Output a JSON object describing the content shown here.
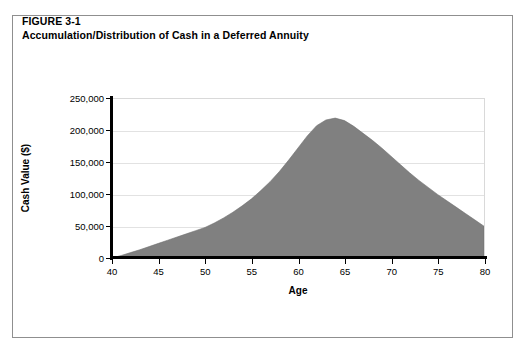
{
  "figure": {
    "label": "FIGURE 3-1",
    "caption": "Accumulation/Distribution of Cash in a Deferred Annuity"
  },
  "colors": {
    "area_fill": "#808080",
    "axis": "#000000",
    "gridline": "#e2e2e2",
    "border": "#8f8f8f",
    "background": "#ffffff"
  },
  "chart_data": {
    "type": "area",
    "title": "Accumulation/Distribution of Cash in a Deferred Annuity",
    "subtitle": "FIGURE 3-1",
    "xlabel": "Age",
    "ylabel": "Cash Value ($)",
    "xlim": [
      40,
      80
    ],
    "ylim": [
      0,
      250000
    ],
    "xticks": [
      40,
      45,
      50,
      55,
      60,
      65,
      70,
      75,
      80
    ],
    "xtick_labels": [
      "40",
      "45",
      "50",
      "55",
      "60",
      "65",
      "70",
      "75",
      "80"
    ],
    "yticks": [
      0,
      50000,
      100000,
      150000,
      200000,
      250000
    ],
    "ytick_labels": [
      "0",
      "50,000",
      "100,000",
      "150,000",
      "200,000",
      "250,000"
    ],
    "grid": "horizontal",
    "legend": null,
    "series": [
      {
        "name": "Cash Value",
        "fill": "#808080",
        "x": [
          40,
          41,
          42,
          43,
          44,
          45,
          46,
          47,
          48,
          49,
          50,
          51,
          52,
          53,
          54,
          55,
          56,
          57,
          58,
          59,
          60,
          61,
          62,
          63,
          64,
          65,
          66,
          67,
          68,
          69,
          70,
          71,
          72,
          73,
          74,
          75,
          76,
          77,
          78,
          79,
          80
        ],
        "values": [
          0,
          4000,
          8500,
          13000,
          18000,
          23000,
          28000,
          33000,
          38000,
          43000,
          48000,
          55000,
          63000,
          72000,
          82000,
          93000,
          106000,
          120000,
          136000,
          154000,
          173000,
          192000,
          208000,
          217000,
          220000,
          216000,
          207000,
          196000,
          185000,
          173000,
          160000,
          147000,
          134000,
          122000,
          111000,
          100000,
          90000,
          80000,
          70000,
          60000,
          50000
        ]
      }
    ],
    "annotations": {
      "peak_age": 64,
      "peak_value": 220000,
      "accumulation_phase": "40-64",
      "distribution_phase": "64-80"
    }
  }
}
